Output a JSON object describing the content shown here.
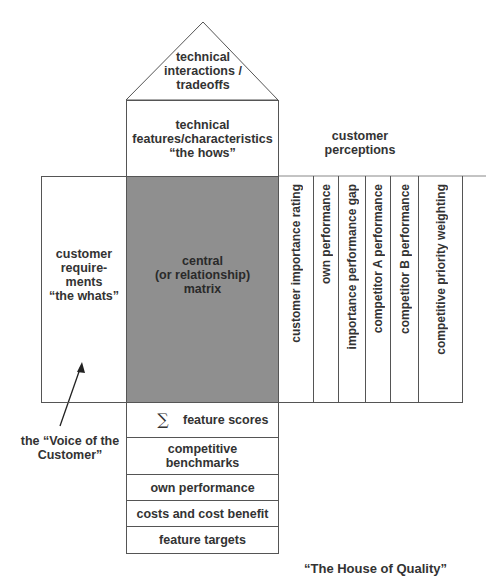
{
  "roof": {
    "label_lines": [
      "technical",
      "interactions /",
      "tradeoffs"
    ]
  },
  "hows": {
    "label_lines": [
      "technical",
      "features/characteristics",
      "“the hows”"
    ]
  },
  "customer_perceptions": {
    "label_lines": [
      "customer",
      "perceptions"
    ]
  },
  "whats": {
    "label_lines": [
      "customer",
      "require-",
      "ments",
      "“the whats”"
    ]
  },
  "matrix": {
    "label_lines": [
      "central",
      "(or relationship)",
      "matrix"
    ],
    "fill": "#8f8f8f"
  },
  "perception_columns": [
    "customer importance rating",
    "own performance",
    "importance performance gap",
    "competitor A performance",
    "competitor B performance",
    "competitive priority weighting"
  ],
  "bottom_rows": [
    {
      "symbol": "∑",
      "label": "feature scores"
    },
    {
      "label": "competitive benchmarks"
    },
    {
      "label": "own performance"
    },
    {
      "label": "costs and cost benefit"
    },
    {
      "label": "feature targets"
    }
  ],
  "voice": {
    "label_lines": [
      "the “Voice of the",
      "Customer”"
    ]
  },
  "title": "“The House of Quality”"
}
